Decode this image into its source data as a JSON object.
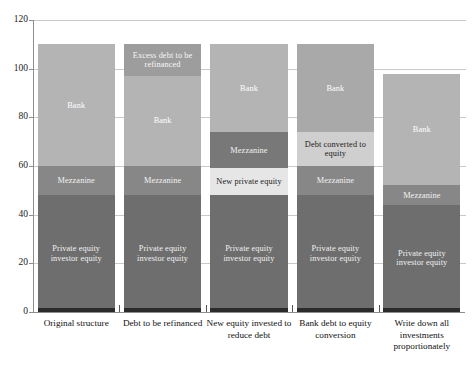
{
  "chart_data": {
    "type": "bar",
    "subtype": "stacked-bar",
    "title": "",
    "subtitle": "",
    "xlabel": "",
    "ylabel": "",
    "ylim": [
      0,
      120
    ],
    "yticks": [
      0,
      20,
      40,
      60,
      80,
      100,
      120
    ],
    "ytick_labels": [
      "0",
      "20",
      "40",
      "60",
      "80",
      "100",
      "120"
    ],
    "grid": true,
    "grid_axis": "y",
    "legend": "none",
    "legend_position": "none",
    "categories": [
      "Original structure",
      "Debt to be refinanced",
      "New equity invested to reduce debt",
      "Bank debt to equity conversion",
      "Write down all investments proportionately"
    ],
    "bars": [
      {
        "category": "Original structure",
        "total": 110,
        "segments": [
          {
            "label": "Private equity investor equity",
            "value": 48,
            "from": 0,
            "to": 48,
            "color": "#6e6e6e",
            "text_color": "#f2f2f2"
          },
          {
            "label": "Mezzanine",
            "value": 12,
            "from": 48,
            "to": 60,
            "color": "#878787",
            "text_color": "#f2f2f2"
          },
          {
            "label": "Bank",
            "value": 50,
            "from": 60,
            "to": 110,
            "color": "#b4b4b4",
            "text_color": "#ffffff"
          }
        ]
      },
      {
        "category": "Debt to be refinanced",
        "total": 110,
        "segments": [
          {
            "label": "Private equity investor equity",
            "value": 48,
            "from": 0,
            "to": 48,
            "color": "#6e6e6e",
            "text_color": "#f2f2f2"
          },
          {
            "label": "Mezzanine",
            "value": 12,
            "from": 48,
            "to": 60,
            "color": "#878787",
            "text_color": "#f2f2f2"
          },
          {
            "label": "Bank",
            "value": 37,
            "from": 60,
            "to": 97,
            "color": "#b4b4b4",
            "text_color": "#ffffff"
          },
          {
            "label": "Excess debt to be refinanced",
            "value": 13,
            "from": 97,
            "to": 110,
            "color": "#9d9d9d",
            "text_color": "#f7f7f7"
          }
        ]
      },
      {
        "category": "New equity invested to reduce debt",
        "total": 110,
        "segments": [
          {
            "label": "Private equity investor equity",
            "value": 48,
            "from": 0,
            "to": 48,
            "color": "#6e6e6e",
            "text_color": "#f2f2f2"
          },
          {
            "label": "New private equity",
            "value": 11,
            "from": 48,
            "to": 59,
            "color": "#e6e6e6",
            "text_color": "#1a1a1a"
          },
          {
            "label": "Mezzanine",
            "value": 15,
            "from": 59,
            "to": 74,
            "color": "#787878",
            "text_color": "#f2f2f2"
          },
          {
            "label": "Bank",
            "value": 36,
            "from": 74,
            "to": 110,
            "color": "#b4b4b4",
            "text_color": "#ffffff"
          }
        ]
      },
      {
        "category": "Bank debt to equity conversion",
        "total": 110,
        "segments": [
          {
            "label": "Private equity investor equity",
            "value": 48,
            "from": 0,
            "to": 48,
            "color": "#6e6e6e",
            "text_color": "#f2f2f2"
          },
          {
            "label": "Mezzanine",
            "value": 12,
            "from": 48,
            "to": 60,
            "color": "#878787",
            "text_color": "#f2f2f2"
          },
          {
            "label": "Debt converted to equity",
            "value": 14,
            "from": 60,
            "to": 74,
            "color": "#cfcfcf",
            "text_color": "#1a1a1a"
          },
          {
            "label": "Bank",
            "value": 36,
            "from": 74,
            "to": 110,
            "color": "#a9a9a9",
            "text_color": "#ffffff"
          }
        ]
      },
      {
        "category": "Write down all investments proportionately",
        "total": 98,
        "segments": [
          {
            "label": "Private equity investor equity",
            "value": 44,
            "from": 0,
            "to": 44,
            "color": "#6e6e6e",
            "text_color": "#f2f2f2"
          },
          {
            "label": "Mezzanine",
            "value": 8,
            "from": 44,
            "to": 52,
            "color": "#878787",
            "text_color": "#f2f2f2"
          },
          {
            "label": "Bank",
            "value": 46,
            "from": 52,
            "to": 98,
            "color": "#b4b4b4",
            "text_color": "#ffffff"
          }
        ]
      }
    ]
  },
  "axis": {
    "y_min": 0,
    "y_max": 120,
    "tick_step": 20
  },
  "colors": {
    "grid": "#c9c9c9",
    "axis": "#8d8d8d",
    "background": "#ffffff",
    "private_equity": "#6e6e6e",
    "mezzanine": "#878787",
    "bank": "#b4b4b4",
    "excess_debt": "#9d9d9d",
    "new_private_equity": "#e6e6e6",
    "debt_converted": "#cfcfcf"
  }
}
